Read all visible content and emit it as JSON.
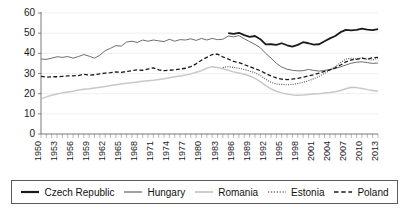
{
  "chart_data": {
    "type": "line",
    "title": "",
    "xlabel": "",
    "ylabel": "",
    "ylim": [
      0,
      60
    ],
    "yticks": [
      0,
      10,
      20,
      30,
      40,
      50,
      60
    ],
    "xlim": [
      1950,
      2013
    ],
    "grid": true,
    "legend_position": "bottom",
    "xtick_labels": [
      "1950",
      "1953",
      "1956",
      "1959",
      "1962",
      "1965",
      "1968",
      "1971",
      "1974",
      "1977",
      "1980",
      "1983",
      "1986",
      "1989",
      "1992",
      "1995",
      "1998",
      "2001",
      "2004",
      "2007",
      "2010",
      "2013"
    ],
    "x": [
      1950,
      1951,
      1952,
      1953,
      1954,
      1955,
      1956,
      1957,
      1958,
      1959,
      1960,
      1961,
      1962,
      1963,
      1964,
      1965,
      1966,
      1967,
      1968,
      1969,
      1970,
      1971,
      1972,
      1973,
      1974,
      1975,
      1976,
      1977,
      1978,
      1979,
      1980,
      1981,
      1982,
      1983,
      1984,
      1985,
      1986,
      1987,
      1988,
      1989,
      1990,
      1991,
      1992,
      1993,
      1994,
      1995,
      1996,
      1997,
      1998,
      1999,
      2000,
      2001,
      2002,
      2003,
      2004,
      2005,
      2006,
      2007,
      2008,
      2009,
      2010,
      2011,
      2012,
      2013
    ],
    "series": [
      {
        "name": "Czech Republic",
        "style": "solid",
        "color": "#1a1a1a",
        "width": 1.8,
        "start_year": 1985,
        "values": [
          null,
          null,
          null,
          null,
          null,
          null,
          null,
          null,
          null,
          null,
          null,
          null,
          null,
          null,
          null,
          null,
          null,
          null,
          null,
          null,
          null,
          null,
          null,
          null,
          null,
          null,
          null,
          null,
          null,
          null,
          null,
          null,
          null,
          null,
          null,
          50.0,
          49.6,
          50.2,
          49.0,
          48.2,
          48.6,
          47.0,
          44.4,
          44.5,
          44.2,
          45.0,
          44.0,
          43.3,
          44.2,
          45.5,
          45.0,
          44.3,
          44.5,
          46.0,
          47.4,
          48.6,
          50.5,
          51.6,
          51.4,
          51.6,
          52.2,
          51.8,
          51.5,
          52.0
        ]
      },
      {
        "name": "Hungary",
        "style": "solid",
        "color": "#6e6e6e",
        "width": 1.0,
        "start_year": 1950,
        "values": [
          37.2,
          37.0,
          37.6,
          38.3,
          38.0,
          38.4,
          37.6,
          38.4,
          39.4,
          38.6,
          37.6,
          39.1,
          41.3,
          42.5,
          43.8,
          43.6,
          45.6,
          46.0,
          45.4,
          46.6,
          46.0,
          46.6,
          46.2,
          45.8,
          47.0,
          46.0,
          46.8,
          46.6,
          47.2,
          46.4,
          47.4,
          46.6,
          47.4,
          46.8,
          47.0,
          48.6,
          48.2,
          48.8,
          47.2,
          45.8,
          44.4,
          42.8,
          40.0,
          37.6,
          35.0,
          33.2,
          32.1,
          31.6,
          31.3,
          31.4,
          32.0,
          31.5,
          31.2,
          31.5,
          32.0,
          32.5,
          33.3,
          34.2,
          35.1,
          35.6,
          35.8,
          35.4,
          35.0,
          35.2
        ]
      },
      {
        "name": "Romania",
        "style": "solid",
        "color": "#c8c8c8",
        "width": 1.5,
        "start_year": 1950,
        "values": [
          17.4,
          18.4,
          19.2,
          19.8,
          20.4,
          20.8,
          21.2,
          21.8,
          22.2,
          22.4,
          22.8,
          23.2,
          23.6,
          24.0,
          24.4,
          24.8,
          25.2,
          25.4,
          25.8,
          26.2,
          26.4,
          26.6,
          27.0,
          27.4,
          27.9,
          28.4,
          28.8,
          29.2,
          29.8,
          30.6,
          31.4,
          32.6,
          33.4,
          33.0,
          32.4,
          31.6,
          30.8,
          30.2,
          29.6,
          28.8,
          27.6,
          26.0,
          24.0,
          22.4,
          21.2,
          20.4,
          19.8,
          19.4,
          19.2,
          19.3,
          19.6,
          19.8,
          20.0,
          20.3,
          20.6,
          21.0,
          21.6,
          22.4,
          23.2,
          23.0,
          22.6,
          22.0,
          21.6,
          21.2
        ]
      },
      {
        "name": "Estonia",
        "style": "dotted",
        "color": "#555555",
        "width": 1.1,
        "start_year": 1984,
        "values": [
          null,
          null,
          null,
          null,
          null,
          null,
          null,
          null,
          null,
          null,
          null,
          null,
          null,
          null,
          null,
          null,
          null,
          null,
          null,
          null,
          null,
          null,
          null,
          null,
          null,
          null,
          null,
          null,
          null,
          null,
          null,
          null,
          null,
          null,
          33.0,
          33.4,
          33.0,
          32.6,
          32.0,
          31.2,
          30.4,
          29.0,
          27.2,
          25.6,
          24.8,
          24.6,
          24.4,
          24.6,
          25.0,
          25.6,
          26.4,
          27.4,
          28.6,
          30.0,
          31.6,
          33.4,
          35.4,
          37.2,
          37.6,
          37.2,
          37.8,
          37.0,
          36.6,
          37.8
        ]
      },
      {
        "name": "Poland",
        "style": "dashed",
        "color": "#1a1a1a",
        "width": 1.3,
        "start_year": 1950,
        "values": [
          28.6,
          28.2,
          28.4,
          28.4,
          28.6,
          28.8,
          28.8,
          29.0,
          29.6,
          29.2,
          29.4,
          29.8,
          30.2,
          30.4,
          30.8,
          30.6,
          31.0,
          31.4,
          31.8,
          31.6,
          32.2,
          32.8,
          31.8,
          31.4,
          31.6,
          31.8,
          32.2,
          32.6,
          33.4,
          34.8,
          36.6,
          38.0,
          39.4,
          39.6,
          38.2,
          37.2,
          36.0,
          35.4,
          34.4,
          33.4,
          32.4,
          31.4,
          30.0,
          28.8,
          27.8,
          27.2,
          27.0,
          27.2,
          27.6,
          28.2,
          28.8,
          29.4,
          30.2,
          31.0,
          31.8,
          32.8,
          34.2,
          35.8,
          36.8,
          37.0,
          37.6,
          37.2,
          37.8,
          38.0
        ]
      }
    ]
  },
  "legend": {
    "entries": [
      {
        "label": "Czech Republic",
        "style": "solid",
        "color": "#1a1a1a",
        "width": 2.2
      },
      {
        "label": "Hungary",
        "style": "solid",
        "color": "#6e6e6e",
        "width": 1.3
      },
      {
        "label": "Romania",
        "style": "solid",
        "color": "#c8c8c8",
        "width": 1.8
      },
      {
        "label": "Estonia",
        "style": "dotted",
        "color": "#777777",
        "width": 1.4
      },
      {
        "label": "Poland",
        "style": "dashed",
        "color": "#1a1a1a",
        "width": 1.5
      }
    ]
  }
}
